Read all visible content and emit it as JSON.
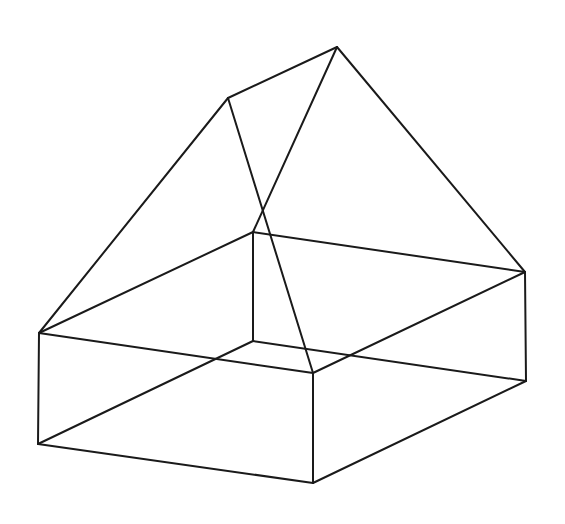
{
  "figure": {
    "stroke_color": "#1a1a1a",
    "background": "#ffffff",
    "vertices": {
      "apex_left": [
        228,
        98
      ],
      "apex_right": [
        337,
        47
      ],
      "top_left": [
        39,
        333
      ],
      "top_back": [
        253,
        232
      ],
      "top_right": [
        525,
        272
      ],
      "top_front": [
        313,
        373
      ],
      "bottom_left": [
        38,
        444
      ],
      "bottom_back": [
        253,
        341
      ],
      "bottom_right": [
        526,
        381
      ],
      "bottom_front": [
        313,
        483
      ]
    },
    "edges": [
      [
        "top_left",
        "apex_left"
      ],
      [
        "apex_left",
        "apex_right"
      ],
      [
        "apex_right",
        "top_right"
      ],
      [
        "apex_left",
        "top_front"
      ],
      [
        "apex_right",
        "top_back"
      ],
      [
        "top_left",
        "top_back"
      ],
      [
        "top_back",
        "top_right"
      ],
      [
        "top_right",
        "top_front"
      ],
      [
        "top_front",
        "top_left"
      ],
      [
        "bottom_left",
        "bottom_back"
      ],
      [
        "bottom_back",
        "bottom_right"
      ],
      [
        "bottom_right",
        "bottom_front"
      ],
      [
        "bottom_front",
        "bottom_left"
      ],
      [
        "top_left",
        "bottom_left"
      ],
      [
        "top_back",
        "bottom_back"
      ],
      [
        "top_right",
        "bottom_right"
      ],
      [
        "top_front",
        "bottom_front"
      ]
    ]
  }
}
